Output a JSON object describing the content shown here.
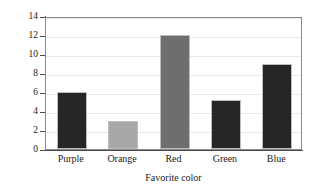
{
  "chart_data": {
    "type": "bar",
    "title": "",
    "subtitle": "",
    "xlabel": "Favorite color",
    "ylabel": "Frequency",
    "categories": [
      "Purple",
      "Orange",
      "Red",
      "Green",
      "Blue"
    ],
    "values": [
      6,
      3,
      12,
      5.2,
      9
    ],
    "bar_colors": [
      "#262626",
      "#a8a8a8",
      "#6e6e6e",
      "#262626",
      "#262626"
    ],
    "ylim": [
      0,
      14
    ],
    "ytick_values": [
      0,
      2,
      4,
      6,
      8,
      10,
      12,
      14
    ],
    "ytick_labels": [
      "0",
      "2",
      "4",
      "6",
      "8",
      "10",
      "12",
      "14"
    ],
    "grid": true,
    "grid_axis": "y",
    "grid_color": "#e8e8e8",
    "legend": false,
    "legend_position": "none",
    "frame": true,
    "frame_color": "#8b8b8b",
    "axis_color": "#4a4a4a",
    "background": "#ffffff",
    "bar_edge_color": "#bdbdbd",
    "annotations": []
  }
}
